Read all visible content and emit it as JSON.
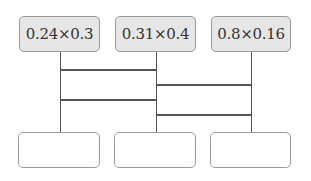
{
  "diagram": {
    "type": "ladder-matching",
    "top_boxes": [
      {
        "label": "0.24×0.3"
      },
      {
        "label": "0.31×0.4"
      },
      {
        "label": "0.8×0.16"
      }
    ],
    "bottom_boxes": [
      {
        "value": ""
      },
      {
        "value": ""
      },
      {
        "value": ""
      }
    ],
    "rungs": [
      {
        "between": "column-1-column-2",
        "order": 1
      },
      {
        "between": "column-2-column-3",
        "order": 2
      },
      {
        "between": "column-1-column-2",
        "order": 3
      },
      {
        "between": "column-2-column-3",
        "order": 4
      }
    ],
    "colors": {
      "top_box_fill": "#e6e6e6",
      "box_border": "#9a9a9a",
      "line": "#555555"
    }
  }
}
